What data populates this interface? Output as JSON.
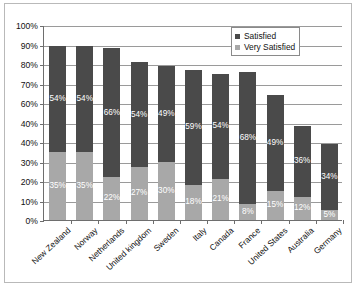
{
  "chart_data": {
    "type": "bar",
    "subtype": "stacked-column",
    "title": "",
    "xlabel": "",
    "ylabel": "",
    "ylim": [
      0,
      100
    ],
    "grid": true,
    "legend_position": "top-right-inside",
    "y_tick_labels": [
      "100%",
      "90%",
      "80%",
      "70%",
      "60%",
      "40%",
      "40%",
      "30%",
      "20%",
      "10%",
      "0%"
    ],
    "y_tick_values": [
      100,
      90,
      80,
      70,
      60,
      50,
      40,
      30,
      20,
      10,
      0
    ],
    "categories": [
      "New Zealand",
      "Norway",
      "Netherlands",
      "United kingdom",
      "Sweden",
      "Italy",
      "Canada",
      "France",
      "United States",
      "Australia",
      "Germany"
    ],
    "series": [
      {
        "name": "Satisfied",
        "color": "#4a4a4a",
        "values": [
          54,
          54,
          66,
          54,
          49,
          59,
          54,
          68,
          49,
          36,
          34
        ],
        "labels": [
          "54%",
          "54%",
          "66%",
          "54%",
          "49%",
          "59%",
          "54%",
          "68%",
          "49%",
          "36%",
          "34%"
        ]
      },
      {
        "name": "Very Satisfied",
        "color": "#a8a8a8",
        "values": [
          35,
          35,
          22,
          27,
          30,
          18,
          21,
          8,
          15,
          12,
          5
        ],
        "labels": [
          "35%",
          "35%",
          "22%",
          "27%",
          "30%",
          "18%",
          "21%",
          "8%",
          "15%",
          "12%",
          "5%"
        ]
      }
    ],
    "totals": [
      89,
      89,
      88,
      81,
      79,
      77,
      75,
      76,
      64,
      48,
      39
    ]
  },
  "legend": {
    "items": [
      {
        "label": "Satisfied",
        "color": "#4a4a4a"
      },
      {
        "label": "Very Satisfied",
        "color": "#a8a8a8"
      }
    ]
  }
}
